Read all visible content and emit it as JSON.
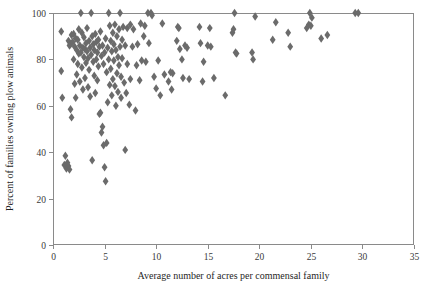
{
  "chart_data": {
    "type": "scatter",
    "title": "",
    "xlabel": "Average number of acres per commensal family",
    "ylabel": "Percent of families owning plow animals",
    "xlim": [
      0,
      35
    ],
    "ylim": [
      0,
      100
    ],
    "xticks": [
      0,
      5,
      10,
      15,
      20,
      25,
      30,
      35
    ],
    "yticks": [
      0,
      20,
      40,
      60,
      80,
      100
    ],
    "xtick_labels": [
      "0",
      "5",
      "10",
      "15",
      "20",
      "25",
      "30",
      "35"
    ],
    "ytick_labels": [
      "0",
      "20",
      "40",
      "60",
      "80",
      "100"
    ],
    "grid": false,
    "legend": false,
    "marker_shape": "diamond",
    "marker_color": "#6b6b6b",
    "frame_color": "#8a8a8a",
    "series": [
      {
        "name": "villages",
        "points": [
          [
            0.8,
            92.0
          ],
          [
            0.8,
            75.0
          ],
          [
            0.9,
            63.5
          ],
          [
            1.1,
            34.5
          ],
          [
            1.2,
            38.5
          ],
          [
            1.3,
            33.0
          ],
          [
            1.4,
            35.5
          ],
          [
            1.5,
            34.0
          ],
          [
            1.5,
            88.0
          ],
          [
            1.6,
            86.0
          ],
          [
            1.6,
            32.5
          ],
          [
            1.7,
            86.5
          ],
          [
            1.7,
            58.5
          ],
          [
            1.8,
            90.5
          ],
          [
            1.8,
            55.0
          ],
          [
            1.9,
            87.5
          ],
          [
            2.0,
            91.0
          ],
          [
            2.0,
            80.0
          ],
          [
            2.1,
            85.5
          ],
          [
            2.1,
            69.5
          ],
          [
            2.2,
            89.0
          ],
          [
            2.2,
            63.5
          ],
          [
            2.3,
            84.0
          ],
          [
            2.3,
            73.5
          ],
          [
            2.4,
            88.5
          ],
          [
            2.4,
            78.0
          ],
          [
            2.5,
            93.0
          ],
          [
            2.5,
            82.5
          ],
          [
            2.6,
            86.0
          ],
          [
            2.6,
            70.5
          ],
          [
            2.7,
            100.0
          ],
          [
            2.7,
            83.0
          ],
          [
            2.8,
            91.5
          ],
          [
            2.8,
            76.5
          ],
          [
            2.9,
            85.0
          ],
          [
            2.9,
            67.0
          ],
          [
            3.0,
            89.5
          ],
          [
            3.0,
            81.0
          ],
          [
            3.1,
            84.5
          ],
          [
            3.1,
            72.0
          ],
          [
            3.2,
            87.0
          ],
          [
            3.2,
            78.5
          ],
          [
            3.3,
            93.5
          ],
          [
            3.3,
            83.5
          ],
          [
            3.4,
            80.5
          ],
          [
            3.4,
            68.0
          ],
          [
            3.5,
            88.0
          ],
          [
            3.5,
            75.5
          ],
          [
            3.6,
            85.0
          ],
          [
            3.6,
            64.0
          ],
          [
            3.7,
            100.0
          ],
          [
            3.7,
            82.0
          ],
          [
            3.8,
            36.5
          ],
          [
            3.8,
            90.0
          ],
          [
            3.9,
            79.0
          ],
          [
            3.9,
            86.5
          ],
          [
            4.0,
            84.0
          ],
          [
            4.0,
            73.0
          ],
          [
            4.1,
            91.0
          ],
          [
            4.1,
            65.5
          ],
          [
            4.2,
            87.5
          ],
          [
            4.2,
            80.0
          ],
          [
            4.3,
            83.0
          ],
          [
            4.3,
            71.0
          ],
          [
            4.4,
            88.5
          ],
          [
            4.4,
            77.0
          ],
          [
            4.5,
            56.5
          ],
          [
            4.5,
            85.5
          ],
          [
            4.6,
            57.0
          ],
          [
            4.6,
            92.0
          ],
          [
            4.7,
            48.5
          ],
          [
            4.7,
            81.5
          ],
          [
            4.8,
            51.0
          ],
          [
            4.8,
            86.0
          ],
          [
            4.9,
            43.0
          ],
          [
            4.9,
            78.0
          ],
          [
            5.0,
            33.5
          ],
          [
            5.0,
            83.0
          ],
          [
            5.1,
            27.5
          ],
          [
            5.1,
            89.0
          ],
          [
            5.2,
            44.0
          ],
          [
            5.2,
            74.5
          ],
          [
            5.3,
            61.5
          ],
          [
            5.3,
            85.0
          ],
          [
            5.4,
            100.0
          ],
          [
            5.4,
            80.0
          ],
          [
            5.5,
            94.5
          ],
          [
            5.5,
            69.0
          ],
          [
            5.6,
            88.0
          ],
          [
            5.6,
            76.0
          ],
          [
            5.7,
            83.5
          ],
          [
            5.7,
            64.5
          ],
          [
            5.8,
            91.5
          ],
          [
            5.8,
            71.5
          ],
          [
            5.9,
            86.5
          ],
          [
            5.9,
            79.5
          ],
          [
            6.0,
            95.0
          ],
          [
            6.0,
            68.5
          ],
          [
            6.1,
            84.0
          ],
          [
            6.1,
            60.0
          ],
          [
            6.2,
            90.0
          ],
          [
            6.2,
            74.0
          ],
          [
            6.3,
            81.0
          ],
          [
            6.3,
            66.0
          ],
          [
            6.4,
            93.0
          ],
          [
            6.4,
            77.5
          ],
          [
            6.5,
            100.0
          ],
          [
            6.5,
            85.5
          ],
          [
            6.6,
            63.5
          ],
          [
            6.6,
            72.5
          ],
          [
            6.7,
            88.5
          ],
          [
            6.7,
            80.5
          ],
          [
            6.8,
            94.0
          ],
          [
            6.9,
            70.0
          ],
          [
            7.0,
            41.0
          ],
          [
            7.0,
            86.0
          ],
          [
            7.1,
            65.5
          ],
          [
            7.2,
            93.5
          ],
          [
            7.2,
            78.0
          ],
          [
            7.4,
            60.5
          ],
          [
            7.5,
            95.0
          ],
          [
            7.5,
            71.5
          ],
          [
            7.7,
            85.5
          ],
          [
            7.8,
            93.0
          ],
          [
            8.0,
            58.0
          ],
          [
            8.1,
            77.5
          ],
          [
            8.2,
            86.5
          ],
          [
            8.4,
            71.0
          ],
          [
            8.5,
            95.5
          ],
          [
            8.6,
            79.5
          ],
          [
            8.8,
            90.0
          ],
          [
            8.9,
            94.5
          ],
          [
            9.0,
            79.0
          ],
          [
            9.2,
            100.0
          ],
          [
            9.3,
            87.0
          ],
          [
            9.5,
            100.0
          ],
          [
            9.6,
            99.0
          ],
          [
            9.8,
            72.5
          ],
          [
            10.0,
            67.5
          ],
          [
            10.2,
            79.5
          ],
          [
            10.4,
            64.5
          ],
          [
            10.6,
            95.5
          ],
          [
            10.8,
            73.5
          ],
          [
            11.2,
            70.5
          ],
          [
            11.4,
            74.5
          ],
          [
            11.5,
            67.0
          ],
          [
            11.6,
            74.0
          ],
          [
            12.0,
            88.0
          ],
          [
            12.1,
            94.0
          ],
          [
            12.2,
            93.5
          ],
          [
            12.3,
            84.5
          ],
          [
            12.5,
            80.0
          ],
          [
            12.6,
            72.0
          ],
          [
            12.8,
            86.0
          ],
          [
            13.0,
            85.0
          ],
          [
            13.2,
            71.5
          ],
          [
            14.2,
            94.0
          ],
          [
            14.3,
            87.0
          ],
          [
            14.5,
            70.5
          ],
          [
            14.6,
            79.0
          ],
          [
            15.0,
            86.0
          ],
          [
            15.2,
            93.5
          ],
          [
            15.3,
            85.5
          ],
          [
            15.6,
            72.0
          ],
          [
            16.7,
            64.5
          ],
          [
            17.4,
            91.5
          ],
          [
            17.5,
            93.0
          ],
          [
            17.6,
            100.0
          ],
          [
            17.7,
            83.0
          ],
          [
            17.8,
            82.5
          ],
          [
            19.3,
            83.0
          ],
          [
            19.4,
            80.0
          ],
          [
            19.6,
            98.5
          ],
          [
            21.3,
            88.5
          ],
          [
            21.6,
            96.0
          ],
          [
            22.8,
            91.5
          ],
          [
            23.0,
            85.5
          ],
          [
            24.6,
            93.5
          ],
          [
            24.8,
            95.0
          ],
          [
            24.9,
            100.0
          ],
          [
            25.0,
            94.5
          ],
          [
            25.1,
            98.0
          ],
          [
            26.0,
            89.0
          ],
          [
            26.6,
            90.5
          ],
          [
            29.3,
            100.0
          ],
          [
            29.6,
            100.0
          ]
        ]
      }
    ]
  },
  "plot_geometry": {
    "left": 53,
    "right": 414,
    "top": 13,
    "bottom": 245
  }
}
